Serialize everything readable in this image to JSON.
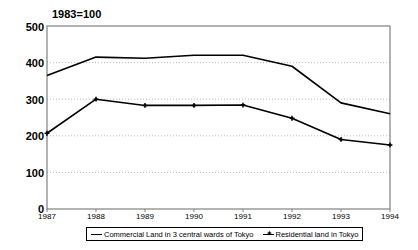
{
  "chart_data": {
    "type": "line",
    "title": "",
    "annotation": "1983=100",
    "xlabel": "",
    "ylabel": "",
    "categories": [
      "1987",
      "1988",
      "1989",
      "1990",
      "1991",
      "1992",
      "1993",
      "1994"
    ],
    "x": [
      1987,
      1988,
      1989,
      1990,
      1991,
      1992,
      1993,
      1994
    ],
    "ylim": [
      0,
      500
    ],
    "yticks": [
      0,
      100,
      200,
      300,
      400,
      500
    ],
    "ytick_labels": [
      "0",
      "100",
      "200",
      "300",
      "400",
      "500"
    ],
    "xtick_labels": [
      "1987",
      "1988",
      "1989",
      "1990",
      "1991",
      "1992",
      "1993",
      "1994"
    ],
    "grid": "horizontal-dotted",
    "legend_position": "bottom-center",
    "series": [
      {
        "name": "Commercial Land in 3 central wards of Tokyo",
        "values": [
          365,
          415,
          412,
          420,
          420,
          390,
          290,
          260
        ],
        "color": "#000000",
        "marker": "none"
      },
      {
        "name": "Residential land in Tokyo",
        "values": [
          207,
          300,
          283,
          283,
          284,
          248,
          190,
          175
        ],
        "color": "#000000",
        "marker": "plus"
      }
    ]
  },
  "legend": {
    "items": [
      {
        "label": "Commercial Land in 3 central wards of Tokyo",
        "marker": "none"
      },
      {
        "label": "Residential land in Tokyo",
        "marker": "plus"
      }
    ]
  },
  "axes": {
    "y_labels": [
      "500",
      "400",
      "300",
      "200",
      "100",
      "0"
    ],
    "x_labels": [
      "1987",
      "1988",
      "1989",
      "1990",
      "1991",
      "1992",
      "1993",
      "1994"
    ]
  },
  "colors": {
    "line": "#000000",
    "frame": "#808080",
    "grid": "#bdbdbd",
    "background": "#ffffff"
  }
}
